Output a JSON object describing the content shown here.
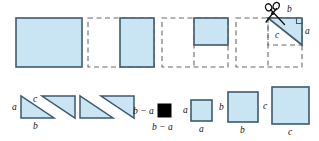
{
  "figure": {
    "colors": {
      "fill": "#c9e4f3",
      "stroke": "#3f5a6b",
      "dashed": "#6b6b6b",
      "black": "#000000",
      "background": "#ffffff",
      "label": "#111111"
    },
    "top_row": {
      "panels": [
        {
          "name": "panel-1-full-rectangle",
          "solid": [
            {
              "shape": "rect",
              "x": 16,
              "y": 18,
              "w": 66,
              "h": 49
            }
          ],
          "dashed": []
        },
        {
          "name": "panel-2-square-b",
          "solid": [
            {
              "shape": "rect",
              "x": 120,
              "y": 18,
              "w": 34,
              "h": 49
            }
          ],
          "dashed": [
            {
              "shape": "rect",
              "x": 88,
              "y": 18,
              "w": 66,
              "h": 49
            }
          ]
        },
        {
          "name": "panel-3-rect-top-right",
          "solid": [
            {
              "shape": "rect",
              "x": 194,
              "y": 18,
              "w": 34,
              "h": 27
            }
          ],
          "dashed": [
            {
              "shape": "rect",
              "x": 162,
              "y": 18,
              "w": 66,
              "h": 49
            }
          ]
        },
        {
          "name": "panel-4-triangle-cut",
          "solid": [],
          "dashed": [
            {
              "shape": "rect",
              "x": 236,
              "y": 18,
              "w": 66,
              "h": 49
            },
            {
              "shape": "rect",
              "x": 268,
              "y": 18,
              "w": 34,
              "h": 27
            }
          ]
        }
      ]
    },
    "cut_triangle": {
      "name": "triangle-being-cut",
      "labels": {
        "hypotenuse": "c",
        "top_leg": "b",
        "right_leg": "a"
      },
      "right_angle_marker": true,
      "scissors": "scissors-icon"
    },
    "bottom_row": {
      "triangles": [
        {
          "name": "triangle-1",
          "labels": {
            "vertical": "a",
            "hypotenuse": "c",
            "horizontal": "b"
          }
        },
        {
          "name": "triangle-2",
          "labels": {}
        },
        {
          "name": "triangle-3",
          "labels": {}
        },
        {
          "name": "triangle-4",
          "labels": {}
        }
      ],
      "squares": [
        {
          "name": "square-b-minus-a",
          "left_label": "b − a",
          "bottom_label": "b − a",
          "fill": "black"
        },
        {
          "name": "square-a",
          "left_label": "a",
          "bottom_label": "a",
          "fill": "blue"
        },
        {
          "name": "square-b",
          "left_label": "b",
          "bottom_label": "b",
          "fill": "blue"
        },
        {
          "name": "square-c",
          "left_label": "c",
          "bottom_label": "c",
          "fill": "blue"
        }
      ]
    }
  }
}
